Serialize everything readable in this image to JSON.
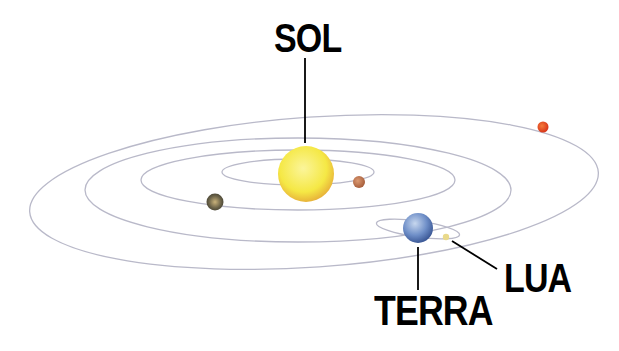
{
  "labels": {
    "sun": "SOL",
    "earth": "TERRA",
    "moon": "LUA"
  },
  "colors": {
    "orbit": "#b9b9c9",
    "sun": "#f6ea4a",
    "sun_edge": "#e9b43a",
    "earth": "#6f8fc8",
    "mars_like_red": "#e2451d",
    "small_brown": "#c07a55",
    "dark_planet": "#5a5440",
    "moon": "#e9d98a",
    "leader_line": "#000000"
  },
  "bodies": [
    "sun",
    "inner brown planet",
    "dark planet",
    "earth",
    "moon",
    "outer red planet"
  ]
}
